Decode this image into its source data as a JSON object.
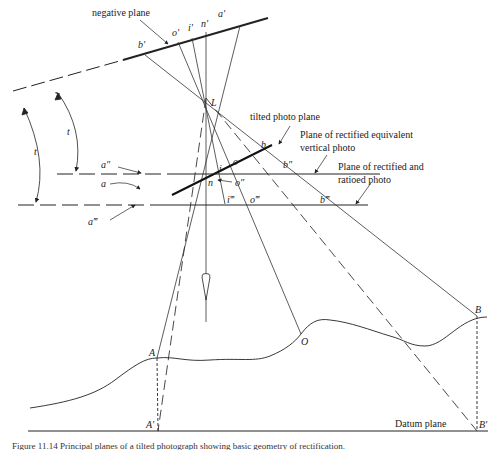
{
  "diagram": {
    "labels": {
      "negative_plane": "negative plane",
      "tilted_photo_plane": "tilted photo plane",
      "rectified_equivalent_line1": "Plane of rectified equivalent",
      "rectified_equivalent_line2": "vertical photo",
      "rectified_ratioed_line1": "Plane of rectified and",
      "rectified_ratioed_line2": "ratioed photo",
      "datum_plane": "Datum plane"
    },
    "points": {
      "b_prime": "b'",
      "o_prime": "o'",
      "i_prime": "i'",
      "n_prime": "n'",
      "a_prime": "a'",
      "L": "L",
      "a_dbl": "a″",
      "a": "a",
      "a_tpl": "a‴",
      "i": "i",
      "o": "o",
      "b": "b",
      "n": "n",
      "b_dbl": "b″",
      "o_dbl": "o″",
      "i_tpl": "i‴",
      "o_tpl": "o‴",
      "b_tpl": "b‴",
      "A": "A",
      "A_prime": "A'",
      "O": "O",
      "B": "B",
      "B_prime": "B'"
    },
    "angles": {
      "t1": "t",
      "t2": "t"
    },
    "caption": "Figure 11.14 Principal planes of a tilted photograph showing basic geometry of rectification."
  }
}
